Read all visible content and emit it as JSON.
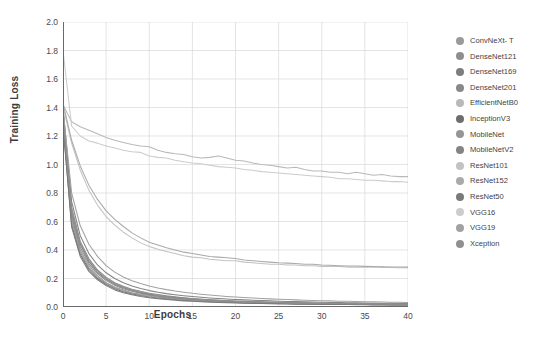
{
  "chart_data": {
    "type": "line",
    "title": "",
    "xlabel": "Epochs",
    "ylabel": "Training Loss",
    "xlim": [
      0,
      40
    ],
    "ylim": [
      0.0,
      2.0
    ],
    "xticks": [
      "0",
      "5",
      "10",
      "15",
      "20",
      "25",
      "30",
      "35",
      "40"
    ],
    "yticks": [
      "0.0",
      "0.2",
      "0.4",
      "0.6",
      "0.8",
      "1.0",
      "1.2",
      "1.4",
      "1.6",
      "1.8",
      "2.0"
    ],
    "grid": true,
    "legend_position": "right",
    "x": [
      0,
      1,
      2,
      3,
      4,
      5,
      6,
      7,
      8,
      9,
      10,
      11,
      12,
      13,
      14,
      15,
      16,
      17,
      18,
      19,
      20,
      21,
      22,
      23,
      24,
      25,
      26,
      27,
      28,
      29,
      30,
      31,
      32,
      33,
      34,
      35,
      36,
      37,
      38,
      39,
      40
    ],
    "series": [
      {
        "name": "ConvNeXt- T",
        "color": "#9a9a9a",
        "values": [
          1.3,
          0.62,
          0.4,
          0.29,
          0.22,
          0.17,
          0.14,
          0.12,
          0.1,
          0.09,
          0.08,
          0.07,
          0.065,
          0.06,
          0.055,
          0.05,
          0.046,
          0.043,
          0.04,
          0.038,
          0.035,
          0.033,
          0.031,
          0.03,
          0.028,
          0.027,
          0.026,
          0.025,
          0.024,
          0.023,
          0.022,
          0.021,
          0.02,
          0.02,
          0.019,
          0.018,
          0.018,
          0.017,
          0.017,
          0.016,
          0.016
        ]
      },
      {
        "name": "DenseNet121",
        "color": "#8e8e8e",
        "values": [
          1.38,
          0.7,
          0.46,
          0.34,
          0.26,
          0.21,
          0.17,
          0.145,
          0.125,
          0.11,
          0.097,
          0.087,
          0.078,
          0.071,
          0.065,
          0.06,
          0.055,
          0.051,
          0.048,
          0.045,
          0.042,
          0.04,
          0.038,
          0.036,
          0.034,
          0.033,
          0.031,
          0.03,
          0.029,
          0.028,
          0.027,
          0.026,
          0.025,
          0.024,
          0.024,
          0.023,
          0.022,
          0.022,
          0.021,
          0.021,
          0.02
        ]
      },
      {
        "name": "DenseNet169",
        "color": "#7d7d7d",
        "values": [
          1.36,
          0.66,
          0.44,
          0.32,
          0.245,
          0.195,
          0.16,
          0.135,
          0.116,
          0.101,
          0.09,
          0.08,
          0.072,
          0.066,
          0.06,
          0.055,
          0.051,
          0.048,
          0.044,
          0.042,
          0.039,
          0.037,
          0.035,
          0.033,
          0.032,
          0.03,
          0.029,
          0.028,
          0.027,
          0.026,
          0.025,
          0.024,
          0.023,
          0.023,
          0.022,
          0.021,
          0.021,
          0.02,
          0.02,
          0.019,
          0.019
        ]
      },
      {
        "name": "DenseNet201",
        "color": "#888888",
        "values": [
          1.34,
          0.64,
          0.42,
          0.305,
          0.235,
          0.185,
          0.152,
          0.128,
          0.11,
          0.096,
          0.085,
          0.076,
          0.069,
          0.063,
          0.058,
          0.053,
          0.049,
          0.046,
          0.043,
          0.04,
          0.038,
          0.036,
          0.034,
          0.032,
          0.031,
          0.029,
          0.028,
          0.027,
          0.026,
          0.025,
          0.024,
          0.023,
          0.023,
          0.022,
          0.021,
          0.021,
          0.02,
          0.02,
          0.019,
          0.019,
          0.018
        ]
      },
      {
        "name": "EfficientNetB0",
        "color": "#b9b9b9",
        "values": [
          1.42,
          1.3,
          1.265,
          1.24,
          1.215,
          1.19,
          1.17,
          1.155,
          1.14,
          1.13,
          1.125,
          1.1,
          1.085,
          1.075,
          1.07,
          1.055,
          1.045,
          1.05,
          1.06,
          1.045,
          1.03,
          1.025,
          1.01,
          1.0,
          0.995,
          0.985,
          0.975,
          0.98,
          0.965,
          0.955,
          0.955,
          0.945,
          0.945,
          0.935,
          0.945,
          0.935,
          0.925,
          0.93,
          0.92,
          0.915,
          0.915
        ]
      },
      {
        "name": "InceptionV3",
        "color": "#6d6d6d",
        "values": [
          1.27,
          0.58,
          0.37,
          0.265,
          0.2,
          0.158,
          0.128,
          0.107,
          0.092,
          0.08,
          0.07,
          0.063,
          0.057,
          0.052,
          0.047,
          0.044,
          0.04,
          0.038,
          0.035,
          0.033,
          0.031,
          0.029,
          0.028,
          0.026,
          0.025,
          0.024,
          0.023,
          0.022,
          0.021,
          0.02,
          0.02,
          0.019,
          0.018,
          0.018,
          0.017,
          0.017,
          0.016,
          0.016,
          0.015,
          0.015,
          0.015
        ]
      },
      {
        "name": "MobileNet",
        "color": "#969696",
        "values": [
          1.32,
          0.6,
          0.385,
          0.275,
          0.21,
          0.165,
          0.135,
          0.113,
          0.097,
          0.084,
          0.074,
          0.066,
          0.06,
          0.055,
          0.05,
          0.046,
          0.043,
          0.04,
          0.037,
          0.035,
          0.033,
          0.031,
          0.029,
          0.028,
          0.027,
          0.025,
          0.024,
          0.023,
          0.023,
          0.022,
          0.021,
          0.02,
          0.02,
          0.019,
          0.018,
          0.018,
          0.017,
          0.017,
          0.016,
          0.016,
          0.016
        ]
      },
      {
        "name": "MobileNetV2",
        "color": "#848484",
        "values": [
          1.4,
          0.74,
          0.5,
          0.375,
          0.295,
          0.24,
          0.2,
          0.17,
          0.147,
          0.13,
          0.115,
          0.104,
          0.094,
          0.086,
          0.079,
          0.073,
          0.068,
          0.063,
          0.059,
          0.056,
          0.053,
          0.05,
          0.047,
          0.045,
          0.043,
          0.041,
          0.039,
          0.038,
          0.036,
          0.035,
          0.033,
          0.032,
          0.031,
          0.03,
          0.029,
          0.028,
          0.027,
          0.027,
          0.026,
          0.025,
          0.025
        ]
      },
      {
        "name": "ResNet101",
        "color": "#c2c2c2",
        "values": [
          1.41,
          1.15,
          0.96,
          0.82,
          0.715,
          0.635,
          0.575,
          0.525,
          0.485,
          0.45,
          0.425,
          0.405,
          0.39,
          0.375,
          0.36,
          0.35,
          0.345,
          0.335,
          0.33,
          0.325,
          0.325,
          0.315,
          0.31,
          0.305,
          0.3,
          0.3,
          0.295,
          0.295,
          0.29,
          0.29,
          0.285,
          0.285,
          0.285,
          0.28,
          0.28,
          0.28,
          0.28,
          0.278,
          0.277,
          0.276,
          0.275
        ]
      },
      {
        "name": "ResNet152",
        "color": "#aaaaaa",
        "values": [
          1.43,
          1.17,
          0.99,
          0.855,
          0.755,
          0.675,
          0.615,
          0.565,
          0.52,
          0.485,
          0.455,
          0.435,
          0.415,
          0.4,
          0.385,
          0.375,
          0.365,
          0.355,
          0.35,
          0.345,
          0.34,
          0.33,
          0.325,
          0.32,
          0.315,
          0.31,
          0.308,
          0.305,
          0.3,
          0.3,
          0.295,
          0.293,
          0.29,
          0.288,
          0.287,
          0.285,
          0.284,
          0.282,
          0.281,
          0.28,
          0.28
        ]
      },
      {
        "name": "ResNet50",
        "color": "#7a7a7a",
        "values": [
          1.29,
          0.56,
          0.355,
          0.25,
          0.19,
          0.15,
          0.12,
          0.1,
          0.086,
          0.074,
          0.065,
          0.058,
          0.052,
          0.047,
          0.043,
          0.04,
          0.037,
          0.034,
          0.032,
          0.03,
          0.028,
          0.027,
          0.025,
          0.024,
          0.023,
          0.022,
          0.021,
          0.02,
          0.02,
          0.019,
          0.018,
          0.018,
          0.017,
          0.017,
          0.016,
          0.016,
          0.015,
          0.015,
          0.014,
          0.014,
          0.014
        ]
      },
      {
        "name": "VGG16",
        "color": "#cccccc",
        "values": [
          1.8,
          1.27,
          1.2,
          1.165,
          1.15,
          1.13,
          1.115,
          1.1,
          1.09,
          1.085,
          1.06,
          1.05,
          1.045,
          1.03,
          1.02,
          1.01,
          1.005,
          0.995,
          0.985,
          0.98,
          0.975,
          0.965,
          0.96,
          0.95,
          0.945,
          0.94,
          0.935,
          0.93,
          0.925,
          0.92,
          0.915,
          0.91,
          0.9,
          0.9,
          0.895,
          0.89,
          0.89,
          0.885,
          0.88,
          0.88,
          0.875
        ]
      },
      {
        "name": "VGG19",
        "color": "#a2a2a2",
        "values": [
          1.39,
          0.8,
          0.57,
          0.44,
          0.355,
          0.29,
          0.245,
          0.21,
          0.185,
          0.165,
          0.148,
          0.134,
          0.122,
          0.112,
          0.104,
          0.096,
          0.09,
          0.084,
          0.079,
          0.074,
          0.07,
          0.066,
          0.063,
          0.06,
          0.057,
          0.055,
          0.052,
          0.05,
          0.048,
          0.046,
          0.044,
          0.043,
          0.041,
          0.04,
          0.039,
          0.037,
          0.036,
          0.035,
          0.034,
          0.033,
          0.032
        ]
      },
      {
        "name": "Xception",
        "color": "#909090",
        "values": [
          1.33,
          0.68,
          0.45,
          0.33,
          0.255,
          0.2,
          0.165,
          0.14,
          0.12,
          0.105,
          0.093,
          0.083,
          0.075,
          0.068,
          0.063,
          0.058,
          0.054,
          0.05,
          0.047,
          0.044,
          0.041,
          0.039,
          0.037,
          0.035,
          0.033,
          0.032,
          0.03,
          0.029,
          0.028,
          0.027,
          0.026,
          0.025,
          0.024,
          0.023,
          0.023,
          0.022,
          0.021,
          0.021,
          0.02,
          0.02,
          0.019
        ]
      }
    ]
  },
  "style": {
    "grid_color": "#d8d8d8",
    "axis_color": "#6a6a6a",
    "background": "#ffffff",
    "tick_text_color": "#4a4a4a",
    "label_text_color": "#3b3b3b"
  }
}
